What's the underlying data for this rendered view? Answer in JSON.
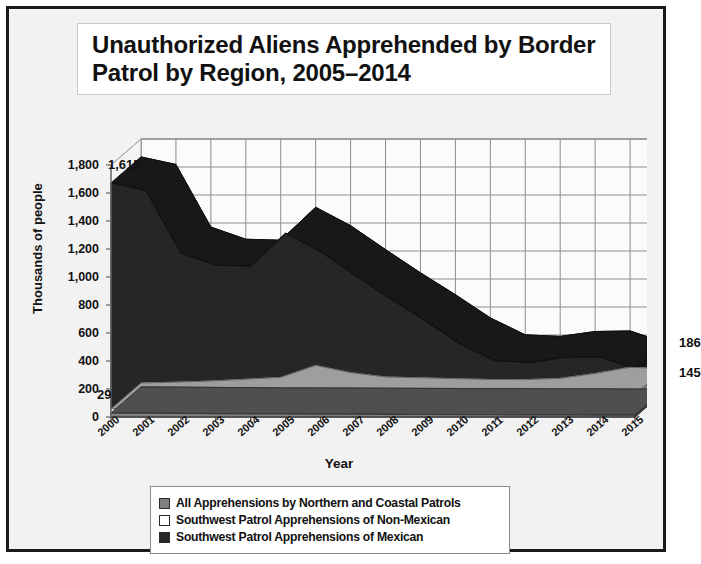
{
  "title": "Unauthorized Aliens Apprehended by Border Patrol by Region, 2005–2014",
  "axis": {
    "ylabel": "Thousands of people",
    "xlabel": "Year"
  },
  "callouts": {
    "peak": "1,615",
    "start_small": "29",
    "end_upper": "186",
    "end_lower": "145"
  },
  "legend": {
    "items": [
      {
        "label": "All Apprehensions by Northern and Coastal Patrols",
        "color": "#808080"
      },
      {
        "label": "Southwest Patrol Apprehensions of Non-Mexican",
        "color": "#ffffff"
      },
      {
        "label": "Southwest Patrol Apprehensions of Mexican",
        "color": "#262626"
      }
    ]
  },
  "chart_data": {
    "type": "area",
    "stacked": true,
    "three_d": true,
    "title": "Unauthorized Aliens Apprehended by Border Patrol by Region, 2005–2014",
    "xlabel": "Year",
    "ylabel": "Thousands of people",
    "ylim": [
      0,
      1800
    ],
    "ytick_step": 200,
    "yticks": [
      0,
      200,
      400,
      600,
      800,
      1000,
      1200,
      1400,
      1600,
      1800
    ],
    "grid": true,
    "legend_position": "bottom",
    "categories": [
      "2000",
      "2001",
      "2002",
      "2003",
      "2004",
      "2005",
      "2006",
      "2007",
      "2008",
      "2009",
      "2010",
      "2011",
      "2012",
      "2013",
      "2014",
      "2015"
    ],
    "series": [
      {
        "name": "Southwest Patrol Apprehensions of Mexican",
        "color": "#262626",
        "values": [
          1615,
          1555,
          1100,
          1000,
          980,
          1130,
          1050,
          910,
          750,
          600,
          440,
          320,
          300,
          300,
          260,
          186
        ]
      },
      {
        "name": "Southwest Patrol Apprehensions of Non-Mexican",
        "color": "#ffffff",
        "values": [
          28,
          35,
          45,
          60,
          75,
          160,
          110,
          80,
          75,
          70,
          65,
          65,
          75,
          110,
          155,
          145
        ]
      },
      {
        "name": "All Apprehensions by Northern and Coastal Patrols",
        "color": "#808080",
        "values": [
          29,
          28,
          26,
          24,
          22,
          22,
          21,
          20,
          19,
          18,
          17,
          16,
          15,
          15,
          14,
          14
        ]
      }
    ],
    "annotations": [
      {
        "text": "1,615",
        "category": "2001",
        "value": 1615
      },
      {
        "text": "29",
        "category": "2000",
        "value": 29
      },
      {
        "text": "186",
        "category": "2015",
        "value": 186
      },
      {
        "text": "145",
        "category": "2015",
        "value": 145
      }
    ]
  }
}
